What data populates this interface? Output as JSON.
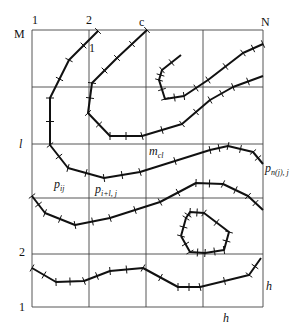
{
  "diagram": {
    "grid": {
      "x_lines": [
        32,
        89,
        146,
        203,
        263
      ],
      "y_lines": [
        30,
        87,
        144,
        198,
        254,
        307
      ],
      "color": "#444444"
    },
    "labels": {
      "col_1": "1",
      "col_2": "2",
      "col_c": "c",
      "col_N": "N",
      "row_M": "M",
      "row_l": "l",
      "row_2": "2",
      "row_1": "1",
      "p_ij": "p",
      "p_ij_sub": "ij",
      "p_i1j": "p",
      "p_i1j_sub": "i+l, j",
      "m_cl": "m",
      "m_cl_sub": "cl",
      "p_nj": "p",
      "p_nj_sub": "n(j), j",
      "h_vertical": "h",
      "h_horizontal": "h",
      "marker_1": "1"
    },
    "curves": [
      {
        "name": "contour-1",
        "points": [
          [
            98,
            31
          ],
          [
            69,
            60
          ],
          [
            50,
            98
          ],
          [
            50,
            145
          ],
          [
            68,
            168
          ],
          [
            104,
            178
          ],
          [
            140,
            172
          ],
          [
            210,
            150
          ],
          [
            228,
            146
          ],
          [
            253,
            152
          ],
          [
            263,
            164
          ]
        ]
      },
      {
        "name": "contour-2",
        "points": [
          [
            147,
            30
          ],
          [
            117,
            58
          ],
          [
            92,
            83
          ],
          [
            88,
            113
          ],
          [
            110,
            136
          ],
          [
            142,
            136
          ],
          [
            182,
            124
          ],
          [
            210,
            100
          ],
          [
            233,
            87
          ],
          [
            263,
            76
          ]
        ]
      },
      {
        "name": "contour-3",
        "points": [
          [
            263,
            44
          ],
          [
            243,
            53
          ],
          [
            208,
            80
          ],
          [
            184,
            96
          ],
          [
            165,
            99
          ],
          [
            159,
            80
          ],
          [
            162,
            70
          ],
          [
            181,
            55
          ]
        ]
      },
      {
        "name": "contour-4",
        "points": [
          [
            32,
            196
          ],
          [
            45,
            213
          ],
          [
            75,
            225
          ],
          [
            110,
            218
          ],
          [
            160,
            202
          ],
          [
            196,
            183
          ],
          [
            223,
            184
          ],
          [
            248,
            196
          ],
          [
            263,
            210
          ]
        ]
      },
      {
        "name": "contour-5",
        "points": [
          [
            181,
            236
          ],
          [
            186,
            218
          ],
          [
            190,
            212
          ],
          [
            204,
            213
          ],
          [
            229,
            232
          ],
          [
            224,
            250
          ],
          [
            205,
            253
          ],
          [
            190,
            252
          ],
          [
            181,
            236
          ]
        ]
      },
      {
        "name": "contour-6",
        "points": [
          [
            32,
            268
          ],
          [
            56,
            282
          ],
          [
            84,
            281
          ],
          [
            110,
            271
          ],
          [
            143,
            268
          ],
          [
            178,
            287
          ],
          [
            200,
            287
          ],
          [
            249,
            275
          ],
          [
            261,
            258
          ]
        ]
      }
    ]
  }
}
